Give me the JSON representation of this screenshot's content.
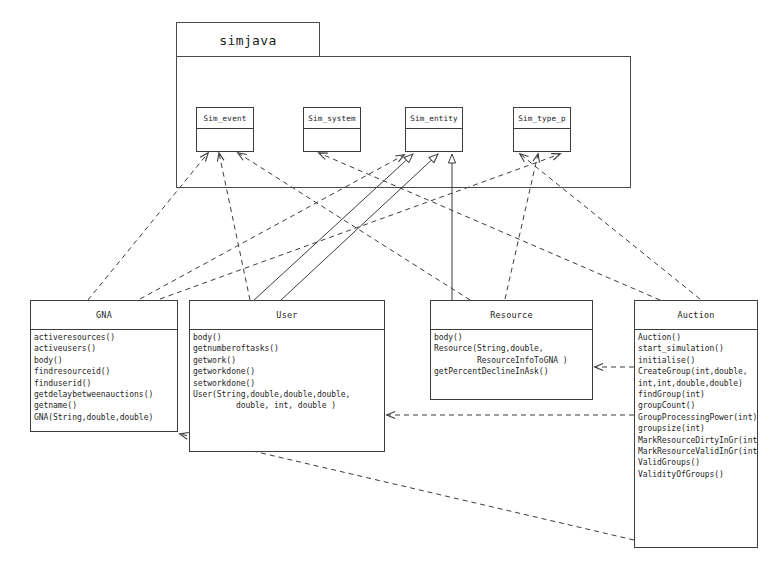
{
  "diagram": {
    "kind": "uml-class-diagram",
    "title_visible": false,
    "stroke_color": "#3d3d3d",
    "background_color": "#ffffff"
  },
  "package": {
    "name": "simjava",
    "tab": {
      "x": 176,
      "y": 22,
      "w": 144,
      "h": 35
    },
    "body": {
      "x": 176,
      "y": 56,
      "w": 455,
      "h": 132
    }
  },
  "classes": [
    {
      "id": "sim_event",
      "name": "Sim_event",
      "members": [],
      "box": {
        "x": 196,
        "y": 107,
        "w": 58,
        "h": 45
      },
      "mini": true
    },
    {
      "id": "sim_system",
      "name": "Sim_system",
      "members": [],
      "box": {
        "x": 303,
        "y": 107,
        "w": 58,
        "h": 45
      },
      "mini": true
    },
    {
      "id": "sim_entity",
      "name": "Sim_entity",
      "members": [],
      "box": {
        "x": 405,
        "y": 107,
        "w": 58,
        "h": 45
      },
      "mini": true
    },
    {
      "id": "sim_type_p",
      "name": "Sim_type_p",
      "members": [],
      "box": {
        "x": 513,
        "y": 107,
        "w": 58,
        "h": 45
      },
      "mini": true
    },
    {
      "id": "gna",
      "name": "GNA",
      "members": [
        "activeresources()",
        "activeusers()",
        "body()",
        "findresourceid()",
        "finduserid()",
        "getdelaybetweenauctions()",
        "getname()",
        "GNA(String,double,double)"
      ],
      "box": {
        "x": 30,
        "y": 300,
        "w": 148,
        "h": 132
      },
      "mini": false
    },
    {
      "id": "user",
      "name": "User",
      "members": [
        "body()",
        "getnumberoftasks()",
        "getwork()",
        "getworkdone()",
        "setworkdone()",
        "User(String,double,double,double,",
        "         double, int, double )"
      ],
      "box": {
        "x": 189,
        "y": 300,
        "w": 196,
        "h": 152
      },
      "mini": false
    },
    {
      "id": "resource",
      "name": "Resource",
      "members": [
        "body()",
        "Resource(String,double,",
        "         ResourceInfoToGNA )",
        "getPercentDeclineInAsk()"
      ],
      "box": {
        "x": 430,
        "y": 300,
        "w": 163,
        "h": 100
      },
      "mini": false
    },
    {
      "id": "auction",
      "name": "Auction",
      "members": [
        "Auction()",
        "start_simulation()",
        "initialise()",
        "CreateGroup(int,double,",
        "int,int,double,double)",
        "findGroup(int)",
        "groupCount()",
        "GroupProcessingPower(int)",
        "groupsize(int)",
        "MarkResourceDirtyInGr(int)",
        "MarkResourceValidInGr(int)",
        "ValidGroups()",
        "ValidityOfGroups()"
      ],
      "box": {
        "x": 634,
        "y": 300,
        "w": 124,
        "h": 248
      },
      "mini": false
    }
  ],
  "relations": [
    {
      "id": "r1",
      "kind": "dependency",
      "from": "gna",
      "to": "sim_event",
      "x1": 88,
      "y1": 300,
      "x2": 208,
      "y2": 153
    },
    {
      "id": "r2",
      "kind": "dependency",
      "from": "user",
      "to": "sim_event",
      "x1": 250,
      "y1": 300,
      "x2": 219,
      "y2": 153
    },
    {
      "id": "r3",
      "kind": "dependency",
      "from": "resource",
      "to": "sim_event",
      "x1": 470,
      "y1": 300,
      "x2": 238,
      "y2": 153
    },
    {
      "id": "r4",
      "kind": "dependency",
      "from": "auction",
      "to": "sim_system",
      "x1": 660,
      "y1": 300,
      "x2": 319,
      "y2": 153
    },
    {
      "id": "r5",
      "kind": "generalization",
      "from": "user",
      "to": "sim_entity",
      "x1": 253,
      "y1": 301,
      "x2": 413,
      "y2": 154
    },
    {
      "id": "r6",
      "kind": "generalization",
      "from": "user",
      "to": "sim_entity",
      "x1": 280,
      "y1": 301,
      "x2": 438,
      "y2": 154
    },
    {
      "id": "r7",
      "kind": "generalization",
      "from": "resource",
      "to": "sim_entity",
      "x1": 452,
      "y1": 301,
      "x2": 452,
      "y2": 154
    },
    {
      "id": "r8",
      "kind": "dependency",
      "from": "gna",
      "to": "sim_entity",
      "x1": 140,
      "y1": 299,
      "x2": 404,
      "y2": 155
    },
    {
      "id": "r9",
      "kind": "dependency",
      "from": "auction",
      "to": "sim_type_p",
      "x1": 700,
      "y1": 299,
      "x2": 520,
      "y2": 154
    },
    {
      "id": "r10",
      "kind": "dependency",
      "from": "resource",
      "to": "sim_type_p",
      "x1": 505,
      "y1": 299,
      "x2": 538,
      "y2": 154
    },
    {
      "id": "r11",
      "kind": "dependency",
      "from": "gna",
      "to": "sim_type_p",
      "x1": 160,
      "y1": 299,
      "x2": 560,
      "y2": 154
    },
    {
      "id": "r12",
      "kind": "dependency",
      "from": "auction",
      "to": "resource",
      "x1": 634,
      "y1": 367,
      "x2": 595,
      "y2": 367
    },
    {
      "id": "r13",
      "kind": "dependency",
      "from": "auction",
      "to": "user",
      "x1": 634,
      "y1": 415,
      "x2": 387,
      "y2": 415
    },
    {
      "id": "r14",
      "kind": "dependency",
      "from": "auction",
      "to": "gna",
      "x1": 634,
      "y1": 540,
      "x2": 180,
      "y2": 434
    }
  ],
  "legend": {
    "dependency_label": "dashed dependency arrow",
    "generalization_label": "solid generalization arrow"
  }
}
